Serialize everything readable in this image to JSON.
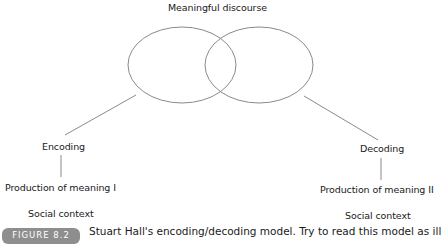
{
  "diagram": {
    "title": "Meaningful discourse",
    "left": {
      "process": "Encoding",
      "production": "Production of meaning I",
      "context": "Social context"
    },
    "right": {
      "process": "Decoding",
      "production": "Production of meaning II",
      "context": "Social context"
    },
    "colors": {
      "line": "#8a8a8a",
      "text": "#1a1a1a",
      "pill": "#8e8e8e"
    }
  },
  "caption": {
    "figure_label": "FIGURE 8.2",
    "text": "Stuart Hall's encoding/decoding model. Try to read this model as ill"
  }
}
